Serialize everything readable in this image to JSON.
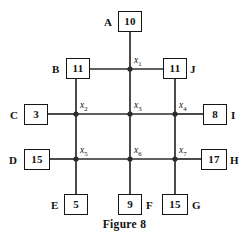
{
  "figure": {
    "caption": "Figure 8",
    "caption_y": 218,
    "background_color": "#ffffff",
    "line_color": "#2b2b2b",
    "box_border_color": "#161616",
    "text_color": "#111111"
  },
  "boxes": [
    {
      "id": "A",
      "letter": "A",
      "value": "10",
      "letter_side": "left",
      "x": 118,
      "y": 11,
      "w": 24,
      "h": 21,
      "letter_x": 104,
      "letter_y": 17
    },
    {
      "id": "B",
      "letter": "B",
      "value": "11",
      "letter_side": "left",
      "x": 66,
      "y": 58,
      "w": 24,
      "h": 21,
      "letter_x": 52,
      "letter_y": 64
    },
    {
      "id": "J",
      "letter": "J",
      "value": "11",
      "letter_side": "right",
      "x": 163,
      "y": 58,
      "w": 24,
      "h": 21,
      "letter_x": 190,
      "letter_y": 64
    },
    {
      "id": "C",
      "letter": "C",
      "value": "3",
      "letter_side": "left",
      "x": 24,
      "y": 104,
      "w": 24,
      "h": 21,
      "letter_x": 10,
      "letter_y": 110
    },
    {
      "id": "I",
      "letter": "I",
      "value": "8",
      "letter_side": "right",
      "x": 203,
      "y": 104,
      "w": 24,
      "h": 21,
      "letter_x": 231,
      "letter_y": 110
    },
    {
      "id": "D",
      "letter": "D",
      "value": "15",
      "letter_side": "left",
      "x": 24,
      "y": 149,
      "w": 26,
      "h": 21,
      "letter_x": 9,
      "letter_y": 155
    },
    {
      "id": "H",
      "letter": "H",
      "value": "17",
      "letter_side": "right",
      "x": 201,
      "y": 149,
      "w": 26,
      "h": 21,
      "letter_x": 230,
      "letter_y": 155
    },
    {
      "id": "E",
      "letter": "E",
      "value": "5",
      "letter_side": "left",
      "x": 64,
      "y": 194,
      "w": 24,
      "h": 21,
      "letter_x": 51,
      "letter_y": 200
    },
    {
      "id": "F",
      "letter": "F",
      "value": "9",
      "letter_side": "right",
      "x": 118,
      "y": 194,
      "w": 24,
      "h": 21,
      "letter_x": 146,
      "letter_y": 200
    },
    {
      "id": "G",
      "letter": "G",
      "value": "15",
      "letter_side": "right",
      "x": 162,
      "y": 194,
      "w": 26,
      "h": 21,
      "letter_x": 192,
      "letter_y": 200
    }
  ],
  "junctions": [
    {
      "id": "x1",
      "label": "x",
      "sub": "1",
      "cx": 130,
      "cy": 69,
      "label_x": 134,
      "label_y": 56
    },
    {
      "id": "x2",
      "label": "x",
      "sub": "2",
      "cx": 76,
      "cy": 114,
      "label_x": 80,
      "label_y": 101
    },
    {
      "id": "x3",
      "label": "x",
      "sub": "3",
      "cx": 130,
      "cy": 114,
      "label_x": 134,
      "label_y": 101
    },
    {
      "id": "x4",
      "label": "x",
      "sub": "4",
      "cx": 175,
      "cy": 114,
      "label_x": 179,
      "label_y": 101
    },
    {
      "id": "x5",
      "label": "x",
      "sub": "5",
      "cx": 76,
      "cy": 159,
      "label_x": 80,
      "label_y": 146
    },
    {
      "id": "x6",
      "label": "x",
      "sub": "6",
      "cx": 130,
      "cy": 159,
      "label_x": 134,
      "label_y": 146
    },
    {
      "id": "x7",
      "label": "x",
      "sub": "7",
      "cx": 175,
      "cy": 159,
      "label_x": 179,
      "label_y": 146
    }
  ],
  "edges": [
    {
      "id": "A-x1",
      "from": "A",
      "to": "x1",
      "x1": 130,
      "y1": 32,
      "x2": 130,
      "y2": 69
    },
    {
      "id": "B-x1",
      "from": "B",
      "to": "x1",
      "x1": 90,
      "y1": 69,
      "x2": 130,
      "y2": 69
    },
    {
      "id": "x1-J",
      "from": "x1",
      "to": "J",
      "x1": 130,
      "y1": 69,
      "x2": 163,
      "y2": 69
    },
    {
      "id": "B-x2",
      "from": "B",
      "to": "x2",
      "x1": 76,
      "y1": 79,
      "x2": 76,
      "y2": 114
    },
    {
      "id": "x1-x3",
      "from": "x1",
      "to": "x3",
      "x1": 130,
      "y1": 69,
      "x2": 130,
      "y2": 114
    },
    {
      "id": "J-x4",
      "from": "J",
      "to": "x4",
      "x1": 175,
      "y1": 79,
      "x2": 175,
      "y2": 114
    },
    {
      "id": "C-x2",
      "from": "C",
      "to": "x2",
      "x1": 48,
      "y1": 114,
      "x2": 76,
      "y2": 114
    },
    {
      "id": "x2-x3",
      "from": "x2",
      "to": "x3",
      "x1": 76,
      "y1": 114,
      "x2": 130,
      "y2": 114
    },
    {
      "id": "x3-x4",
      "from": "x3",
      "to": "x4",
      "x1": 130,
      "y1": 114,
      "x2": 175,
      "y2": 114
    },
    {
      "id": "x4-I",
      "from": "x4",
      "to": "I",
      "x1": 175,
      "y1": 114,
      "x2": 203,
      "y2": 114
    },
    {
      "id": "x2-x5",
      "from": "x2",
      "to": "x5",
      "x1": 76,
      "y1": 114,
      "x2": 76,
      "y2": 159
    },
    {
      "id": "x3-x6",
      "from": "x3",
      "to": "x6",
      "x1": 130,
      "y1": 114,
      "x2": 130,
      "y2": 159
    },
    {
      "id": "x4-x7",
      "from": "x4",
      "to": "x7",
      "x1": 175,
      "y1": 114,
      "x2": 175,
      "y2": 159
    },
    {
      "id": "D-x5",
      "from": "D",
      "to": "x5",
      "x1": 50,
      "y1": 159,
      "x2": 76,
      "y2": 159
    },
    {
      "id": "x5-x6",
      "from": "x5",
      "to": "x6",
      "x1": 76,
      "y1": 159,
      "x2": 130,
      "y2": 159
    },
    {
      "id": "x6-x7",
      "from": "x6",
      "to": "x7",
      "x1": 130,
      "y1": 159,
      "x2": 175,
      "y2": 159
    },
    {
      "id": "x7-H",
      "from": "x7",
      "to": "H",
      "x1": 175,
      "y1": 159,
      "x2": 201,
      "y2": 159
    },
    {
      "id": "x5-E",
      "from": "x5",
      "to": "E",
      "x1": 76,
      "y1": 159,
      "x2": 76,
      "y2": 194
    },
    {
      "id": "x6-F",
      "from": "x6",
      "to": "F",
      "x1": 130,
      "y1": 159,
      "x2": 130,
      "y2": 194
    },
    {
      "id": "x7-G",
      "from": "x7",
      "to": "G",
      "x1": 175,
      "y1": 159,
      "x2": 175,
      "y2": 194
    }
  ]
}
